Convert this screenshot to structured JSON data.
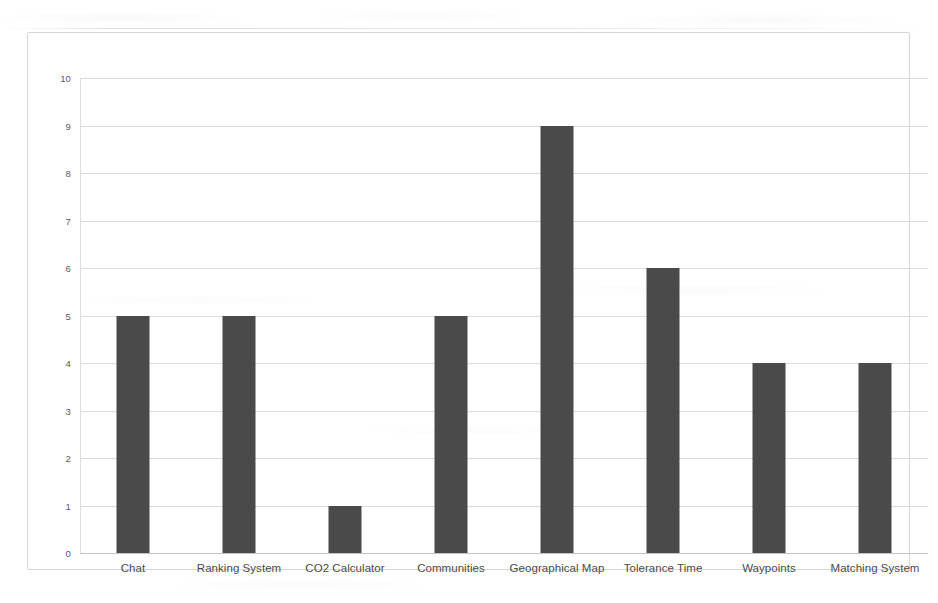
{
  "chart_data": {
    "type": "bar",
    "title": "",
    "subtitle": "",
    "xlabel": "",
    "ylabel": "",
    "categories": [
      "Chat",
      "Ranking System",
      "CO2 Calculator",
      "Communities",
      "Geographical Map",
      "Tolerance Time",
      "Waypoints",
      "Matching System"
    ],
    "values": [
      5,
      5,
      1,
      5,
      9,
      6,
      4,
      4
    ],
    "ylim": [
      0,
      10
    ],
    "ytick_labels": [
      "10",
      "9",
      "8",
      "7",
      "6",
      "5",
      "4",
      "3",
      "2",
      "1",
      "0"
    ],
    "ytick_values": [
      10,
      9,
      8,
      7,
      6,
      5,
      4,
      3,
      2,
      1,
      0
    ],
    "grid": true,
    "legend": false,
    "legend_position": "none",
    "series": [
      {
        "name": "",
        "values": [
          5,
          5,
          1,
          5,
          9,
          6,
          4,
          4
        ]
      }
    ]
  },
  "style": {
    "bar_color": "#4a4a4a",
    "grid_color": "#dcdcdc",
    "frame_color": "#d6d6d6",
    "tick_text_color": "#595959",
    "label_text_color": "#4b4b4b",
    "background_color": "#ffffff"
  }
}
